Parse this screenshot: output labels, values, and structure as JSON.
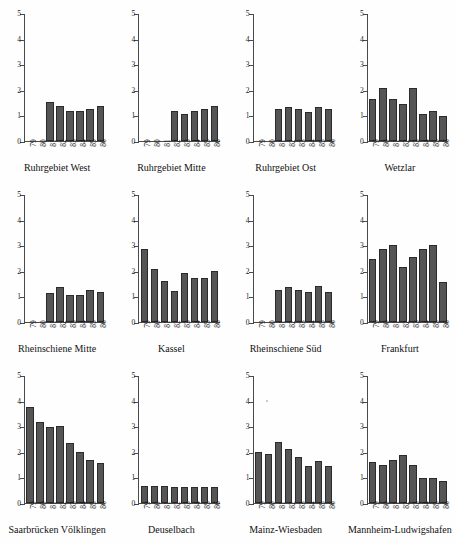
{
  "figure": {
    "type": "small-multiples-bar-chart",
    "panel_count": 12,
    "columns": 4,
    "rows": 3,
    "bar_color": "#555555",
    "axis_color": "#4a4a4a",
    "background": "#ffffff"
  },
  "axis": {
    "y_ticks": [
      "0",
      "1",
      "2",
      "3",
      "4",
      "5"
    ],
    "y_min": 0,
    "y_max": 5,
    "x_categories": [
      "79",
      "80",
      "81",
      "82",
      "83",
      "84",
      "85",
      "86"
    ]
  },
  "chart_data": {
    "type": "bar",
    "title": "",
    "xlabel": "",
    "ylabel": "",
    "ylim": [
      0,
      5
    ],
    "grid": false,
    "legend": "none",
    "categories": [
      "79",
      "80",
      "81",
      "82",
      "83",
      "84",
      "85",
      "86"
    ],
    "panels": [
      {
        "title": "Ruhrgebiet West",
        "values": [
          null,
          null,
          1.55,
          1.37,
          1.18,
          1.2,
          1.27,
          1.38
        ]
      },
      {
        "title": "Ruhrgebiet Mitte",
        "values": [
          null,
          null,
          null,
          1.18,
          1.07,
          1.18,
          1.27,
          1.38
        ]
      },
      {
        "title": "Ruhrgebiet Ost",
        "values": [
          null,
          null,
          1.25,
          1.33,
          1.26,
          1.15,
          1.33,
          1.25
        ]
      },
      {
        "title": "Wetzlar",
        "values": [
          1.67,
          2.07,
          1.67,
          1.47,
          2.08,
          1.05,
          1.18,
          0.97
        ]
      },
      {
        "title": "Rheinschiene Mitte",
        "values": [
          null,
          null,
          1.15,
          1.37,
          1.07,
          1.07,
          1.27,
          1.18
        ]
      },
      {
        "title": "Kassel",
        "values": [
          2.87,
          2.08,
          1.62,
          1.22,
          1.92,
          1.72,
          1.72,
          2.02
        ]
      },
      {
        "title": "Rheinschiene Süd",
        "values": [
          null,
          null,
          1.25,
          1.37,
          1.28,
          1.2,
          1.4,
          1.2
        ]
      },
      {
        "title": "Frankfurt",
        "values": [
          2.48,
          2.87,
          3.03,
          2.17,
          2.57,
          2.87,
          3.05,
          1.57
        ]
      },
      {
        "title": "Saarbrücken Völklingen",
        "values": [
          3.78,
          3.17,
          2.98,
          3.02,
          2.38,
          2.02,
          1.68,
          1.57
        ]
      },
      {
        "title": "Deuselbach",
        "values": [
          0.68,
          0.68,
          0.68,
          0.65,
          0.63,
          0.63,
          0.63,
          0.63
        ]
      },
      {
        "title": "Mainz-Wiesbaden",
        "values": [
          2.0,
          1.92,
          2.4,
          2.12,
          1.82,
          1.47,
          1.67,
          1.47
        ]
      },
      {
        "title": "Mannheim-Ludwigshafen",
        "values": [
          1.6,
          1.48,
          1.68,
          1.9,
          1.48,
          0.98,
          0.98,
          0.88
        ]
      }
    ]
  }
}
